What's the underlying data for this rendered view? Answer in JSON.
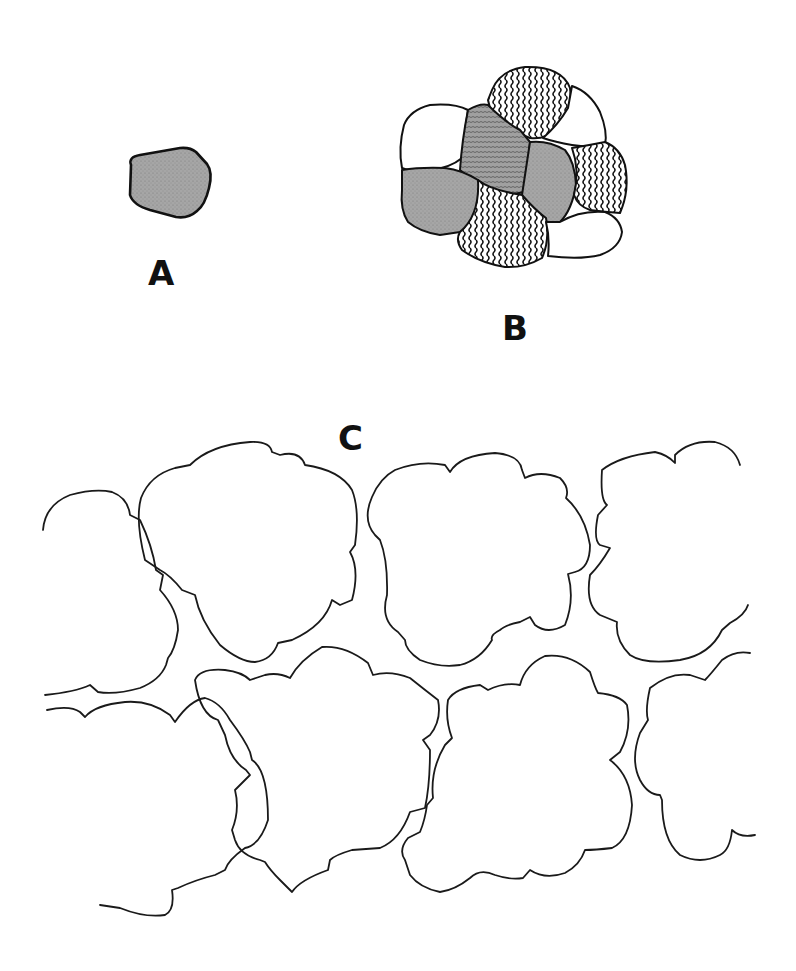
{
  "figure": {
    "type": "cell-illustration",
    "panels": [
      {
        "id": "A",
        "label": "A",
        "description": "single isolated cell, stippled gray"
      },
      {
        "id": "B",
        "label": "B",
        "description": "cluster of 9 cells with mixed fills: stippled gray, wavy-striped, plain white"
      },
      {
        "id": "C",
        "label": "C",
        "description": "sheet of large lobed cells with irregular wavy outlines, two rows"
      }
    ]
  },
  "colors": {
    "stipple": "#9a9a9a",
    "outline": "#111111",
    "background": "#ffffff"
  },
  "legend_fills": {
    "gray": "stippled",
    "striped": "wavy-lines",
    "white": "plain"
  }
}
